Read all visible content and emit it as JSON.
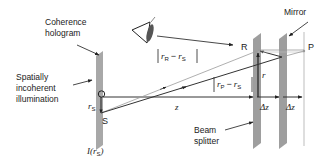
{
  "labels": {
    "coherence_hologram": [
      "Coherence",
      "hologram"
    ],
    "illumination": [
      "Spatially",
      "incoherent",
      "illumination"
    ],
    "mirror": "Mirror",
    "beam_splitter": [
      "Beam",
      "splitter"
    ],
    "point_O": "O",
    "point_S": "S",
    "point_R": "R",
    "point_P": "P",
    "r_s": {
      "main": "r",
      "sub": "S"
    },
    "r": "r",
    "z": "z",
    "delta_z_1": "Δz",
    "delta_z_2": "Δz",
    "intensity": {
      "prefix": "I(",
      "main": "r",
      "sub": "S",
      "suffix": ")"
    },
    "dist_R_S": {
      "r1": "r",
      "sub1": "R",
      "minus": "−",
      "r2": "r",
      "sub2": "S"
    },
    "dist_P_S": {
      "r1": "r",
      "sub1": "P",
      "minus": "−",
      "r2": "r",
      "sub2": "S"
    }
  },
  "icons": {
    "observer": "eye-icon"
  },
  "colors": {
    "plate": "#a8a8a8",
    "line": "#333333",
    "ray_light": "#9a9a9a",
    "text": "#222222"
  }
}
